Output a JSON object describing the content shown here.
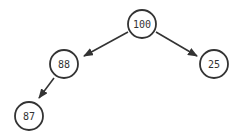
{
  "diagram": {
    "type": "binary-tree",
    "nodes": [
      {
        "id": "n100",
        "label": "100",
        "x": 142,
        "y": 24
      },
      {
        "id": "n88",
        "label": "88",
        "x": 64,
        "y": 64
      },
      {
        "id": "n25",
        "label": "25",
        "x": 214,
        "y": 64
      },
      {
        "id": "n87",
        "label": "87",
        "x": 29,
        "y": 116
      }
    ],
    "edges": [
      {
        "from": "n100",
        "to": "n88"
      },
      {
        "from": "n100",
        "to": "n25"
      },
      {
        "from": "n88",
        "to": "n87"
      }
    ],
    "colors": {
      "stroke": "#333333",
      "fill": "#ffffff"
    }
  }
}
